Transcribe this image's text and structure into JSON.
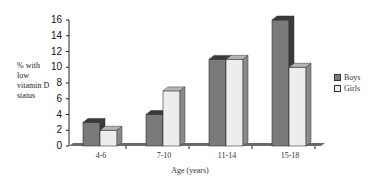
{
  "chart_data": {
    "type": "bar",
    "title": "",
    "xlabel": "Age (years)",
    "ylabel": "% with low vitamin D status",
    "ylim": [
      0,
      16
    ],
    "yticks": [
      0,
      2,
      4,
      6,
      8,
      10,
      12,
      14,
      16
    ],
    "categories": [
      "4-6",
      "7-10",
      "11-14",
      "15-18"
    ],
    "series": [
      {
        "name": "Boys",
        "values": [
          3,
          4,
          11,
          16
        ],
        "color": "#7a7a7a"
      },
      {
        "name": "Girls",
        "values": [
          2,
          7,
          11,
          10
        ],
        "color": "#ededed"
      }
    ],
    "legend_position": "right",
    "grid": false,
    "style": "3d"
  },
  "ylabel_lines": [
    "% with",
    "low",
    "vitamin D",
    "status"
  ]
}
